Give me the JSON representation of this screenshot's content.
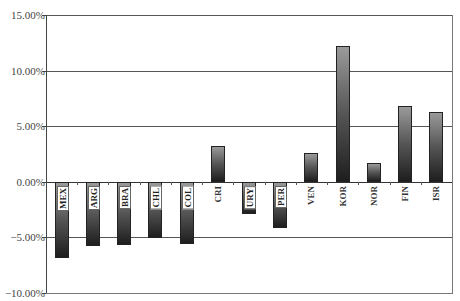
{
  "chart_data": {
    "type": "bar",
    "title": "",
    "xlabel": "",
    "ylabel": "",
    "categories": [
      "MEX",
      "ARG",
      "BRA",
      "CHL",
      "COL",
      "CRI",
      "URY",
      "PER",
      "VEN",
      "KOR",
      "NOR",
      "FIN",
      "ISR"
    ],
    "values": [
      -6.85,
      -5.8,
      -5.7,
      -5.0,
      -5.6,
      3.2,
      -2.9,
      -4.1,
      2.6,
      12.2,
      1.7,
      6.8,
      6.3
    ],
    "value_unit": "%",
    "ylim": [
      -10,
      15
    ],
    "yticks": [
      15,
      10,
      5,
      0,
      -5,
      -10
    ],
    "ytick_labels": [
      "15.00%",
      "10.00%",
      "5.00%",
      "0.00%",
      "-5.00%",
      "-10.00%"
    ],
    "grid": true,
    "legend": null,
    "bar_style": "vertical gray gradient, light top to dark bottom",
    "label_position": "category labels rotated vertically just below zero line; boxed white labels inside negative bars"
  },
  "colors": {
    "background": "#ffffff",
    "gridline": "#555555",
    "bar_light": "#9a9a9a",
    "bar_dark": "#1e1e1e"
  }
}
